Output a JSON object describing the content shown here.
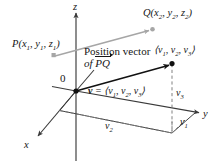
{
  "figure": {
    "colors": {
      "axis": "#3a3a3a",
      "vector_black": "#111111",
      "vector_gray": "#a6a6a6",
      "dashed": "#7a7a7a",
      "background": "#ffffff"
    },
    "labels": {
      "origin": "0",
      "axis_x": "x",
      "axis_y": "y",
      "axis_z": "z",
      "point_p": {
        "name": "P",
        "open": "(",
        "coord1": "x",
        "coord1_sub": "1",
        "coord2": "y",
        "coord2_sub": "1",
        "coord3": "z",
        "coord3_sub": "1",
        "close": ")",
        "full": "P(x1, y1, z1)"
      },
      "point_q": {
        "name": "Q",
        "open": "(",
        "coord1": "x",
        "coord1_sub": "2",
        "coord2": "y",
        "coord2_sub": "2",
        "coord3": "z",
        "coord3_sub": "2",
        "close": ")",
        "full": "Q(x2, y2, z2)"
      },
      "position_vector_line1": "Position vector",
      "position_vector_line2_prefix": "of",
      "position_vector_line2_segment": "PQ",
      "tip_point": {
        "open": "⟨",
        "c1": "v",
        "c1_sub": "1",
        "c2": "v",
        "c2_sub": "2",
        "c3": "v",
        "c3_sub": "3",
        "close": "⟩",
        "full": "⟨v1, v2, v3⟩"
      },
      "vector_equation": {
        "symbol": "v",
        "equals": "=",
        "open": "⟨",
        "c1": "v",
        "c1_sub": "1",
        "c2": "v",
        "c2_sub": "2",
        "c3": "v",
        "c3_sub": "3",
        "close": "⟩",
        "full": "v = ⟨v1, v2, v3⟩"
      },
      "component_v1": {
        "base": "v",
        "sub": "1",
        "full": "v1"
      },
      "component_v2": {
        "base": "v",
        "sub": "2",
        "full": "v2"
      },
      "component_v3": {
        "base": "v",
        "sub": "3",
        "full": "v3"
      }
    },
    "geometry": {
      "origin": [
        76,
        91
      ],
      "z_axis_top": [
        76,
        12
      ],
      "z_axis_bottom": [
        76,
        161
      ],
      "y_axis_end": [
        201,
        113
      ],
      "x_axis_end": [
        36,
        138
      ],
      "p_point": [
        54,
        56
      ],
      "q_point": [
        152,
        29
      ],
      "v_tip": [
        172,
        64
      ],
      "v1_foot": [
        172,
        118
      ],
      "v2_corner": [
        60,
        110
      ]
    }
  }
}
